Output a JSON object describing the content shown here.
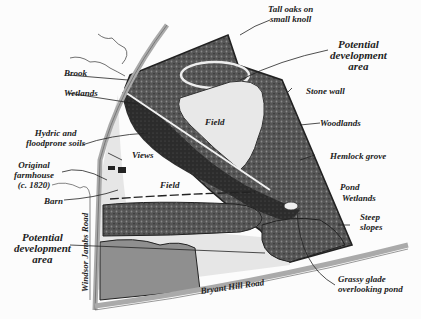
{
  "map": {
    "type": "site plan",
    "colors": {
      "woodland": "#5a5a5a",
      "field": "#e4e4e4",
      "wetland": "#2e2e2e",
      "road": "#bdbdbd",
      "development_lower": "#8c8c8c",
      "outline": "#222222"
    },
    "labels": {
      "tall_oaks": [
        "Tall oaks on",
        "small knoll"
      ],
      "potential_dev_top": [
        "Potential",
        "development",
        "area"
      ],
      "stone_wall": "Stone wall",
      "woodlands": "Woodlands",
      "hemlock_grove": "Hemlock grove",
      "pond": "Pond",
      "wetlands_right": "Wetlands",
      "steep_slopes": [
        "Steep",
        "slopes"
      ],
      "grassy_glade": [
        "Grassy glade",
        "overlooking pond"
      ],
      "brook": "Brook",
      "wetlands_left": "Wetlands",
      "hydric": [
        "Hydric and",
        "floodprone soils"
      ],
      "views": "Views",
      "farmhouse": [
        "Original",
        "farmhouse",
        "(c. 1820)"
      ],
      "barn": "Barn",
      "field_upper": "Field",
      "field_lower": "Field",
      "potential_dev_left": [
        "Potential",
        "development",
        "area"
      ],
      "windsor_jambs_road": "Windsor   Jambs   Road",
      "bryant_hill_road": "Bryant Hill Road"
    }
  }
}
